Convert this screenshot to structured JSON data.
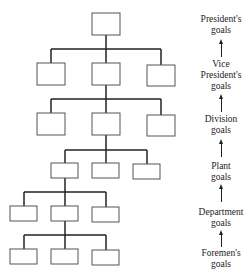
{
  "diagram": {
    "type": "organizational hierarchy",
    "levels": 6,
    "goals": [
      {
        "label": "President's goals",
        "lines": [
          "President's",
          "goals"
        ]
      },
      {
        "label": "Vice President's goals",
        "lines": [
          "Vice",
          "President's",
          "goals"
        ]
      },
      {
        "label": "Division goals",
        "lines": [
          "Division",
          "goals"
        ]
      },
      {
        "label": "Plant goals",
        "lines": [
          "Plant",
          "goals"
        ]
      },
      {
        "label": "Department goals",
        "lines": [
          "Department",
          "goals"
        ]
      },
      {
        "label": "Foremen's goals",
        "lines": [
          "Foremen's",
          "goals"
        ]
      }
    ],
    "colors": {
      "line": "#222222",
      "box_border": "#555555",
      "text": "#222222"
    }
  }
}
